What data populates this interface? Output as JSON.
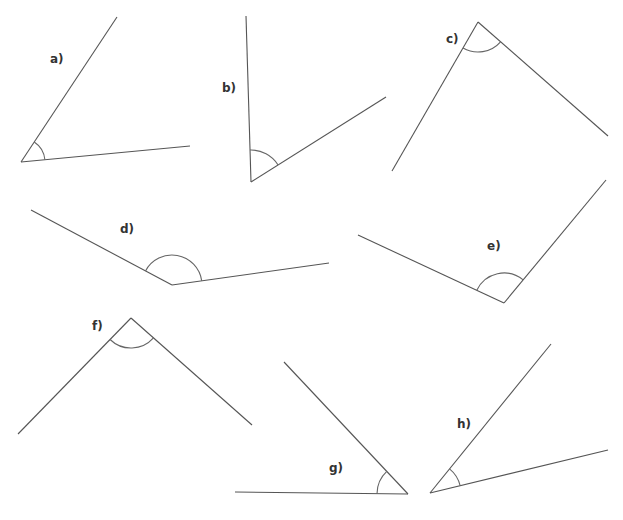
{
  "diagram": {
    "line_color": "#555555",
    "arc_color": "#666666",
    "angles": [
      {
        "id": "a",
        "label": "a)",
        "vertex": [
          21,
          162
        ],
        "ends": [
          [
            117,
            17
          ],
          [
            190,
            146
          ]
        ],
        "arc_r": 24,
        "label_pos": [
          50,
          53
        ]
      },
      {
        "id": "b",
        "label": "b)",
        "vertex": [
          251,
          182
        ],
        "ends": [
          [
            246,
            16
          ],
          [
            386,
            97
          ]
        ],
        "arc_r": 32,
        "label_pos": [
          222,
          82
        ]
      },
      {
        "id": "c",
        "label": "c)",
        "vertex": [
          478,
          22
        ],
        "ends": [
          [
            392,
            171
          ],
          [
            608,
            136
          ]
        ],
        "arc_r": 30,
        "label_pos": [
          446,
          33
        ]
      },
      {
        "id": "d",
        "label": "d)",
        "vertex": [
          172,
          285
        ],
        "ends": [
          [
            31,
            210
          ],
          [
            329,
            263
          ]
        ],
        "arc_r": 30,
        "label_pos": [
          120,
          223
        ]
      },
      {
        "id": "e",
        "label": "e)",
        "vertex": [
          504,
          303
        ],
        "ends": [
          [
            358,
            235
          ],
          [
            606,
            180
          ]
        ],
        "arc_r": 30,
        "label_pos": [
          487,
          240
        ]
      },
      {
        "id": "f",
        "label": "f)",
        "vertex": [
          131,
          318
        ],
        "ends": [
          [
            18,
            434
          ],
          [
            252,
            425
          ]
        ],
        "arc_r": 30,
        "label_pos": [
          92,
          320
        ]
      },
      {
        "id": "g",
        "label": "g)",
        "vertex": [
          408,
          494
        ],
        "ends": [
          [
            284,
            362
          ],
          [
            235,
            492
          ]
        ],
        "arc_r": 31,
        "label_pos": [
          329,
          462
        ]
      },
      {
        "id": "h",
        "label": "h)",
        "vertex": [
          430,
          493
        ],
        "ends": [
          [
            551,
            344
          ],
          [
            608,
            450
          ]
        ],
        "arc_r": 31,
        "label_pos": [
          457,
          418
        ]
      }
    ]
  }
}
